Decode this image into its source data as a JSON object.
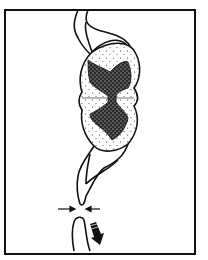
{
  "figure": {
    "colors": {
      "stroke": "#111111",
      "background": "#ffffff",
      "gray_matter": "#2a2a2a",
      "white_matter_dots": "#333333"
    },
    "elements": [
      "spinal-cord-cross-section",
      "gray-matter-butterfly",
      "upper-nerve-root",
      "lower-nerve-root",
      "compression-arrows",
      "severed-nerve-stump",
      "downward-arrow"
    ]
  }
}
